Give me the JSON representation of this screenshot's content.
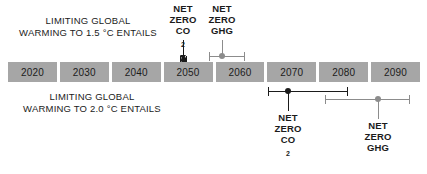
{
  "figure": {
    "type": "timeline",
    "x_axis": {
      "label": "",
      "tick_labels": [
        "2020",
        "2030",
        "2040",
        "2050",
        "2060",
        "2070",
        "2080",
        "2090"
      ],
      "range_start": 2015,
      "range_end": 2095
    },
    "colors": {
      "bar_fill": "#a6a6a6",
      "bar_gap": "#ffffff",
      "co2_marker": "#1b1b1b",
      "ghg_marker": "#8c8c8c",
      "text": "#1b1b1b",
      "background": "#ffffff"
    }
  },
  "scenarios": [
    {
      "id": "warming-1p5",
      "caption_line1": "LIMITING GLOBAL",
      "caption_line2": "WARMING TO 1.5 °C ENTAILS",
      "caption_position": "above-left",
      "markers": [
        {
          "id": "net-zero-co2-1p5",
          "label_line1": "NET",
          "label_line2": "ZERO",
          "label_line3": "CO",
          "label_sub": "2",
          "label_position": "above",
          "color": "#1b1b1b",
          "central_year": 2050,
          "range_start_year": 2049,
          "range_end_year": 2052
        },
        {
          "id": "net-zero-ghg-1p5",
          "label_line1": "NET",
          "label_line2": "ZERO",
          "label_line3": "GHG",
          "label_sub": "",
          "label_position": "above",
          "color": "#8c8c8c",
          "central_year": 2058,
          "range_start_year": 2055,
          "range_end_year": 2062
        }
      ]
    },
    {
      "id": "warming-2p0",
      "caption_line1": "LIMITING GLOBAL",
      "caption_line2": "WARMING TO 2.0 °C ENTAILS",
      "caption_position": "below-left",
      "markers": [
        {
          "id": "net-zero-co2-2p0",
          "label_line1": "NET",
          "label_line2": "ZERO",
          "label_line3": "CO",
          "label_sub": "2",
          "label_position": "below",
          "color": "#1b1b1b",
          "central_year": 2070,
          "range_start_year": 2066,
          "range_end_year": 2081
        },
        {
          "id": "net-zero-ghg-2p0",
          "label_line1": "NET",
          "label_line2": "ZERO",
          "label_line3": "GHG",
          "label_sub": "",
          "label_position": "below",
          "color": "#8c8c8c",
          "central_year": 2087,
          "range_start_year": 2077,
          "range_end_year": 2093
        }
      ]
    }
  ]
}
